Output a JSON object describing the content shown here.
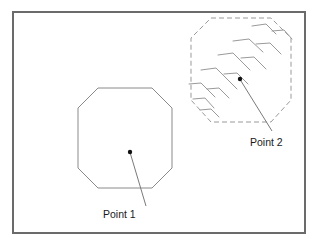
{
  "figure": {
    "background_color": "#ffffff",
    "frame": {
      "name": "outer-border-frame",
      "x": 13,
      "y": 12,
      "width": 292,
      "height": 221,
      "stroke_color": "#6b6b6b",
      "stroke_width": 2,
      "fill": "none"
    }
  },
  "shapes": [
    {
      "id": "octagon-solid",
      "label": "solid-octagon-region",
      "line_style": "solid",
      "stroke_color": "#8a8a8a",
      "stroke_width": 1,
      "fill": "none",
      "points": "98,88 152,88 172,108 172,168 152,188 98,188 78,168 78,108"
    },
    {
      "id": "octagon-dashed",
      "label": "dashed-octagon-region",
      "line_style": "dashed",
      "dash_pattern": "5,3",
      "stroke_color": "#9a9a9a",
      "stroke_width": 1,
      "fill": "none",
      "points": "211,18 271,18 291,38 291,100 271,122 211,122 191,100 191,38"
    }
  ],
  "hatch_marks": {
    "name": "hatch-pattern-group",
    "description": "bent chevron tick marks inside dashed octagon",
    "stroke_color": "#9a9a9a",
    "stroke_width": 1,
    "segments": [
      "M 252,26 L 266,24 L 276,34",
      "M 272,31 L 284,30 L 292,39",
      "M 233,41 L 249,39 L 263,52",
      "M 256,44 L 270,43 L 281,54",
      "M 218,55 L 233,53 L 250,70",
      "M 241,58 L 254,57 L 266,69",
      "M 201,70 L 216,68 L 237,89",
      "M 224,74 L 237,73 L 248,84",
      "M 189,84 L 201,83 L 215,97",
      "M 207,89 L 219,88 L 229,98",
      "M 193,99 L 205,98 L 214,108",
      "M 200,110 L 211,109 L 219,117"
    ]
  },
  "points": [
    {
      "id": "point-1",
      "label": "Point 1",
      "marker": {
        "x": 130,
        "y": 152,
        "radius": 2.2,
        "color": "#111111"
      },
      "leader_line": {
        "x1": 130.5,
        "y1": 154,
        "x2": 146,
        "y2": 206,
        "stroke_color": "#7a7a7a",
        "stroke_width": 1
      },
      "text_position": {
        "x": 103,
        "y": 218,
        "anchor": "start"
      }
    },
    {
      "id": "point-2",
      "label": "Point 2",
      "marker": {
        "x": 240,
        "y": 79,
        "radius": 2.2,
        "color": "#111111"
      },
      "leader_line": {
        "x1": 241,
        "y1": 81,
        "x2": 272,
        "y2": 131,
        "stroke_color": "#7a7a7a",
        "stroke_width": 1
      },
      "text_position": {
        "x": 250,
        "y": 146,
        "anchor": "start"
      }
    }
  ],
  "colors": {
    "frame": "#6b6b6b",
    "shape_solid": "#8a8a8a",
    "shape_dashed": "#9a9a9a",
    "hatch": "#9a9a9a",
    "marker": "#111111",
    "leader": "#7a7a7a",
    "text": "#1a1a1a",
    "background": "#ffffff"
  }
}
